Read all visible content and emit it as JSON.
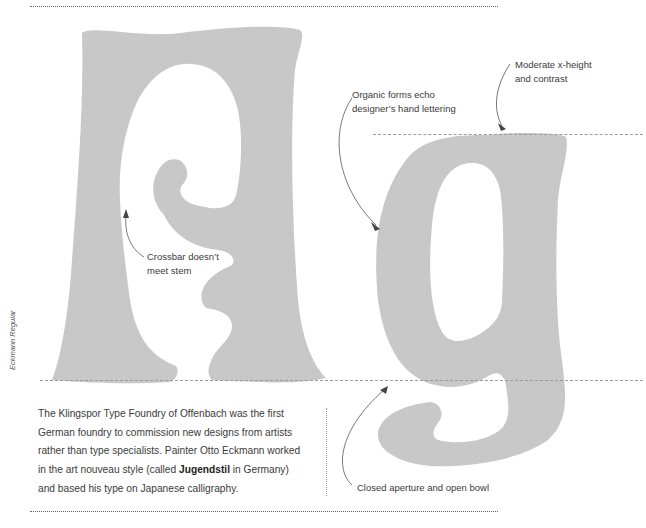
{
  "figure": {
    "font_name_vertical": "Eckmann Regular",
    "glyphs": [
      "A",
      "g"
    ],
    "glyph_color": "#c8c8c8",
    "annotations": {
      "moderate_xheight": {
        "line1": "Moderate x-height",
        "line2": "and contrast"
      },
      "organic_forms": {
        "line1": "Organic forms echo",
        "line2": "designer’s hand lettering"
      },
      "crossbar": {
        "line1": "Crossbar doesn’t",
        "line2": "meet stem"
      },
      "closed_aperture": {
        "line1": "Closed aperture and open bowl"
      }
    },
    "caption": {
      "part1": "The Klingspor Type Foundry of Offenbach was the first German foundry to commission new designs from artists rather than type specialists. Painter Otto Eckmann worked in the art nouveau style (called ",
      "emphasis": "Jugendstil",
      "part2": " in Germany) and based his type on Japanese calligraphy."
    }
  }
}
